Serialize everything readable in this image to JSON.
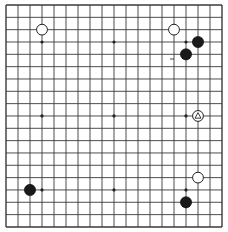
{
  "board": {
    "size": 19,
    "origin_x": 6,
    "origin_y": 5,
    "spacing_x": 12.0,
    "spacing_y": 12.33,
    "line_color": "#3a3a3a",
    "background": "#ffffff",
    "star_points": [
      [
        3,
        3
      ],
      [
        9,
        3
      ],
      [
        15,
        3
      ],
      [
        3,
        9
      ],
      [
        9,
        9
      ],
      [
        15,
        9
      ],
      [
        3,
        15
      ],
      [
        9,
        15
      ],
      [
        15,
        15
      ]
    ],
    "stones": [
      {
        "color": "white",
        "col": 3,
        "row": 2,
        "marker": ""
      },
      {
        "color": "white",
        "col": 14,
        "row": 2,
        "marker": ""
      },
      {
        "color": "black",
        "col": 16,
        "row": 3,
        "marker": ""
      },
      {
        "color": "black",
        "col": 15,
        "row": 4,
        "marker": ""
      },
      {
        "color": "white",
        "col": 16,
        "row": 9,
        "marker": "triangle"
      },
      {
        "color": "white",
        "col": 16,
        "row": 14,
        "marker": ""
      },
      {
        "color": "black",
        "col": 2,
        "row": 15,
        "marker": ""
      },
      {
        "color": "black",
        "col": 15,
        "row": 16,
        "marker": ""
      }
    ],
    "marks": [
      {
        "type": "dash",
        "x": 172,
        "y": 59
      }
    ]
  }
}
